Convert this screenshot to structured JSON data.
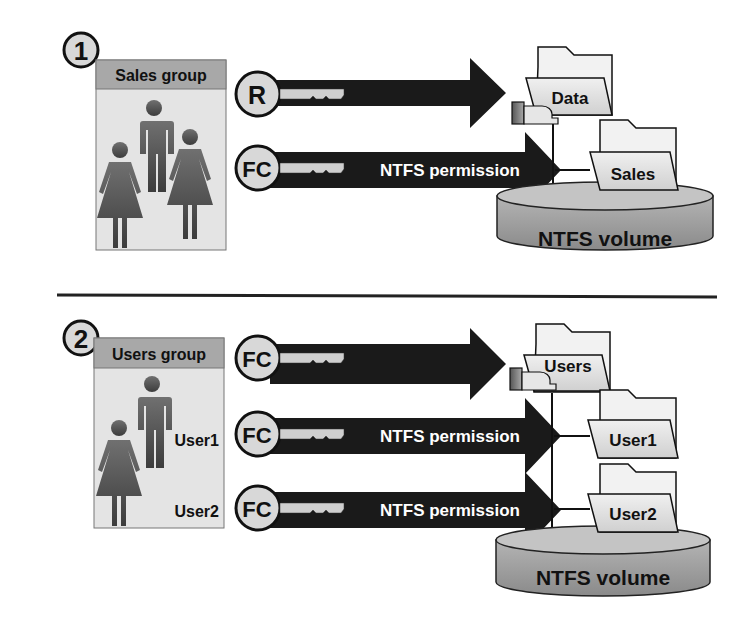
{
  "sections": [
    {
      "step": "1",
      "group": {
        "title": "Sales group",
        "members": []
      },
      "arrows": [
        {
          "key_label": "R",
          "text": ""
        },
        {
          "key_label": "FC",
          "text": "NTFS permission"
        }
      ],
      "folders": [
        {
          "label": "Data",
          "shared": true
        },
        {
          "label": "Sales",
          "shared": false
        }
      ],
      "volume": "NTFS volume"
    },
    {
      "step": "2",
      "group": {
        "title": "Users group",
        "members": [
          "User1",
          "User2"
        ]
      },
      "arrows": [
        {
          "key_label": "FC",
          "text": ""
        },
        {
          "key_label": "FC",
          "text": "NTFS permission"
        },
        {
          "key_label": "FC",
          "text": "NTFS permission"
        }
      ],
      "folders": [
        {
          "label": "Users",
          "shared": true
        },
        {
          "label": "User1",
          "shared": false
        },
        {
          "label": "User2",
          "shared": false
        }
      ],
      "volume": "NTFS volume"
    }
  ],
  "colors": {
    "arrow": "#1a1a1a",
    "person": "#555555",
    "group_bg": "#e4e4e4",
    "group_header": "#a8a8a8",
    "folder": "#e6e6e6",
    "volume": "#9a9a9a"
  }
}
